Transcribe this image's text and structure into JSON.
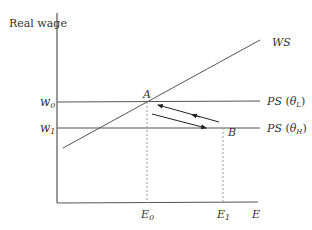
{
  "diagram": {
    "y_axis_label": "Real wage",
    "x_axis_label": "E",
    "curves": {
      "ws": {
        "label": "WS"
      },
      "ps_low": {
        "label_main": "PS",
        "label_sym": "θ",
        "label_sub": "L"
      },
      "ps_high": {
        "label_main": "PS",
        "label_sym": "θ",
        "label_sub": "H"
      }
    },
    "y_ticks": [
      {
        "label": "w",
        "sub": "0"
      },
      {
        "label": "w",
        "sub": "1"
      }
    ],
    "x_ticks": [
      {
        "label": "E",
        "sub": "0"
      },
      {
        "label": "E",
        "sub": "1"
      }
    ],
    "points": [
      {
        "label": "A"
      },
      {
        "label": "B"
      }
    ],
    "colors": {
      "line": "#555555",
      "text": "#333333",
      "arrow": "#222222",
      "dashed": "#999999"
    }
  }
}
